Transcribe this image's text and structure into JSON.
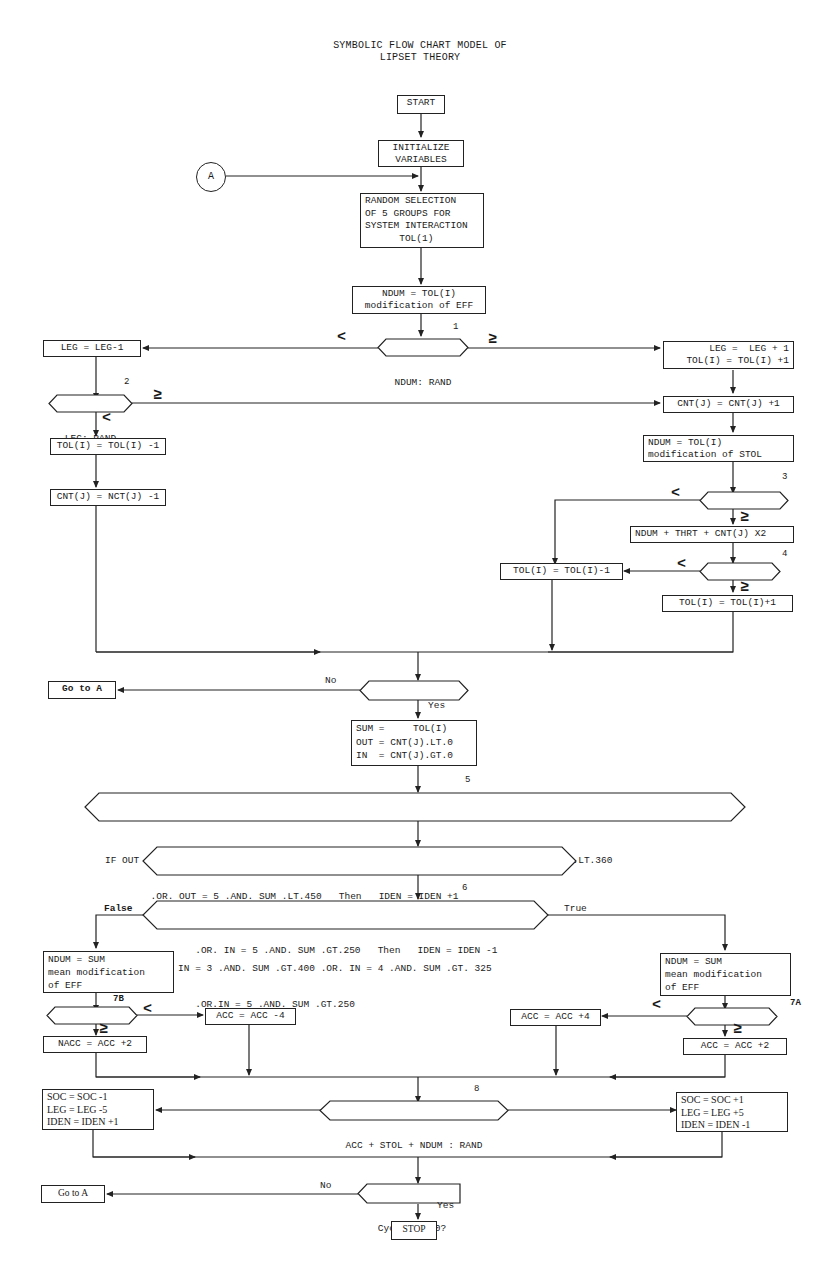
{
  "title": {
    "line1": "SYMBOLIC FLOW CHART MODEL OF",
    "line2": "LIPSET THEORY"
  },
  "nodes": {
    "start": "START",
    "init": "INITIALIZE\nVARIABLES",
    "connector_a": "A",
    "random_selection": "RANDOM SELECTION\nOF 5 GROUPS FOR\nSYSTEM INTERACTION\n      TOL(1)",
    "ndum_eff": "NDUM = TOL(I)\nmodification of EFF",
    "decision1": "NDUM: RAND",
    "leg_minus": "LEG = LEG-1",
    "leg_plus": "  LEG =  LEG + 1\nTOL(I) = TOL(I) +1",
    "decision2": "LEG: RAND",
    "cnt_plus": "CNT(J) = CNT(J) +1",
    "tol_minus_left": "TOL(I) = TOL(I) -1",
    "cnt_minus": "CNT(J) = NCT(J) -1",
    "ndum_stol": "NDUM = TOL(I)\nmodification of STOL",
    "decision3": "NDUM: RAND",
    "ndum_thrt": "NDUM + THRT + CNT(J) X2",
    "decision4": "NDUM: RAND",
    "tol_minus_mid": "TOL(I) = TOL(I)-1",
    "tol_plus_right": "TOL(I) = TOL(I)+1",
    "passes": "Passes = 25?",
    "goto_a_1": "Go to A",
    "sum_box": "SUM =     TOL(I)\nOUT = CNT(J).LT.0\nIN  = CNT(J).GT.0",
    "if5_line1": "IF OUT = 2 .AND. SUM .LT.180 .OR. OUT = 3 .AND. SUM .LT.270 .OR OUT = 4 .AND. SUM .LT.360",
    "if5_line2": "        .OR. OUT = 5 .AND. SUM .LT.450   Then   IDEN = IDEN +1",
    "ifin_line1": "IF IN = 3 .AND. SUM .GT.400 .OR. IN = 4 .AND. SUM .GT.325",
    "ifin_line2": "      .OR. IN = 5 .AND. SUM .GT.250   Then   IDEN = IDEN -1",
    "if6_line1": "IF IN = 3 .AND. SUM .GT.400 .OR. IN = 4 .AND. SUM .GT. 325",
    "if6_line2": "      .OR.IN = 5 .AND. SUM .GT.250",
    "ndum_sum_left": "NDUM = SUM\nmean modification\nof EFF",
    "ndum_sum_right": "NDUM = SUM\nmean modification\nof EFF",
    "decision7b": "NDUM : RAND",
    "decision7a": "NDUM : RAND",
    "acc_minus4": "ACC = ACC -4",
    "nacc_plus2": "NACC = ACC +2",
    "acc_plus4": "ACC = ACC +4",
    "acc_plus2": "ACC = ACC +2",
    "decision8": "ACC + STOL + NDUM : RAND",
    "soc_left": "SOC = SOC -1\nLEG = LEG -5\nIDEN = IDEN +1",
    "soc_right": "SOC = SOC +1\nLEG = LEG +5\nIDEN = IDEN -1",
    "cycles": "Cycles = 10?",
    "goto_a_2": "Go to A",
    "stop": "STOP"
  },
  "labels": {
    "lt": "<",
    "ge": "≥",
    "no": "No",
    "yes": "Yes",
    "false": "False",
    "true": "True",
    "if_keyword": "IF"
  },
  "step_numbers": {
    "s1": "1",
    "s2": "2",
    "s3": "3",
    "s4": "4",
    "s5": "5",
    "s6": "6",
    "s7a": "7A",
    "s7b": "7B",
    "s8": "8"
  }
}
